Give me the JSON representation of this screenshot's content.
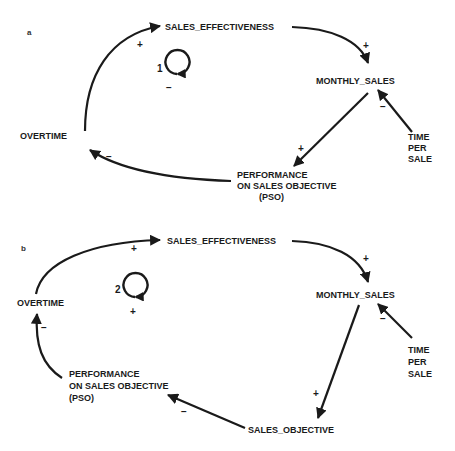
{
  "panels": [
    {
      "id": "a",
      "label": "a",
      "nodes": {
        "sales_effectiveness": "SALES_EFFECTIVENESS",
        "monthly_sales": "MONTHLY_SALES",
        "time_per_sale": [
          "TIME",
          "PER",
          "SALE"
        ],
        "pso": [
          "PERFORMANCE",
          "ON SALES OBJECTIVE",
          "(PSO)"
        ],
        "overtime": "OVERTIME"
      },
      "loop": {
        "number": "1",
        "polarity": "−"
      },
      "edges": [
        {
          "from": "OVERTIME",
          "to": "SALES_EFFECTIVENESS",
          "sign": "+"
        },
        {
          "from": "SALES_EFFECTIVENESS",
          "to": "MONTHLY_SALES",
          "sign": "+"
        },
        {
          "from": "TIME PER SALE",
          "to": "MONTHLY_SALES",
          "sign": "−"
        },
        {
          "from": "MONTHLY_SALES",
          "to": "PSO",
          "sign": "+"
        },
        {
          "from": "PSO",
          "to": "OVERTIME",
          "sign": "−"
        }
      ]
    },
    {
      "id": "b",
      "label": "b",
      "nodes": {
        "sales_effectiveness": "SALES_EFFECTIVENESS",
        "monthly_sales": "MONTHLY_SALES",
        "time_per_sale": [
          "TIME",
          "PER",
          "SALE"
        ],
        "pso": [
          "PERFORMANCE",
          "ON SALES  OBJECTIVE",
          "(PSO)"
        ],
        "overtime": "OVERTIME",
        "sales_objective": "SALES_OBJECTIVE"
      },
      "loop": {
        "number": "2",
        "polarity": "+"
      },
      "edges": [
        {
          "from": "OVERTIME",
          "to": "SALES_EFFECTIVENESS",
          "sign": "+"
        },
        {
          "from": "SALES_EFFECTIVENESS",
          "to": "MONTHLY_SALES",
          "sign": "+"
        },
        {
          "from": "TIME PER SALE",
          "to": "MONTHLY_SALES",
          "sign": "−"
        },
        {
          "from": "MONTHLY_SALES",
          "to": "SALES_OBJECTIVE",
          "sign": "+"
        },
        {
          "from": "SALES_OBJECTIVE",
          "to": "PSO",
          "sign": "−"
        },
        {
          "from": "PSO",
          "to": "OVERTIME",
          "sign": "−"
        }
      ]
    }
  ]
}
